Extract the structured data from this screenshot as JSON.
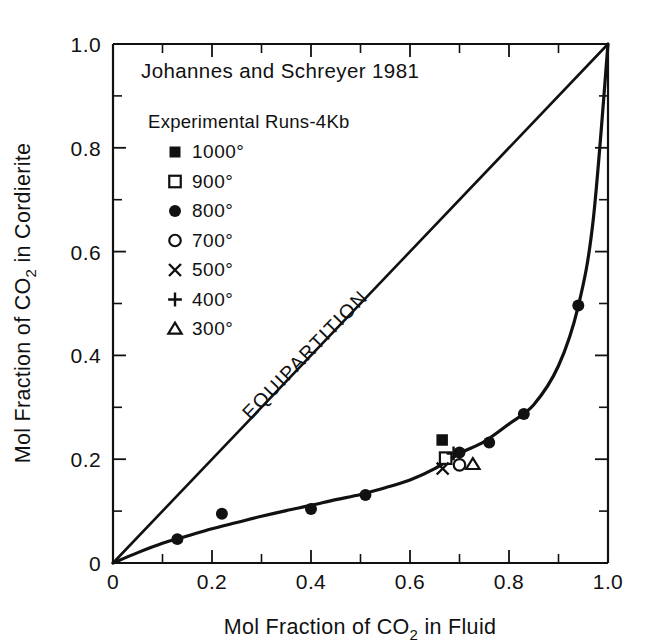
{
  "figure": {
    "title": "Johannes and Schreyer 1981",
    "legend_heading": "Experimental Runs-4Kb",
    "equipartition_label": "EQUIPARTITION"
  },
  "axes": {
    "x": {
      "title_part1": "Mol Fraction of CO",
      "title_sub": "2",
      "title_part2": " in Fluid",
      "ticks": [
        "0",
        "0.2",
        "0.4",
        "0.6",
        "0.8",
        "1.0"
      ],
      "tick_values": [
        0,
        0.2,
        0.4,
        0.6,
        0.8,
        1.0
      ],
      "minor_step": 0.1,
      "range": [
        0,
        1.0
      ]
    },
    "y": {
      "title_part1": "Mol Fraction of CO",
      "title_sub": "2",
      "title_part2": " in Cordierite",
      "ticks": [
        "0",
        "0.2",
        "0.4",
        "0.6",
        "0.8",
        "1.0"
      ],
      "tick_values": [
        0,
        0.2,
        0.4,
        0.6,
        0.8,
        1.0
      ],
      "minor_step": 0.1,
      "range": [
        0,
        1.0
      ]
    }
  },
  "legend": {
    "items": [
      {
        "marker": "filled-square",
        "label": "1000°"
      },
      {
        "marker": "open-square",
        "label": "900°"
      },
      {
        "marker": "filled-circle",
        "label": "800°"
      },
      {
        "marker": "open-circle",
        "label": "700°"
      },
      {
        "marker": "x-cross",
        "label": "500°"
      },
      {
        "marker": "plus",
        "label": "400°"
      },
      {
        "marker": "open-triangle",
        "label": "300°"
      }
    ]
  },
  "chart_data": {
    "type": "scatter",
    "title": "Johannes and Schreyer 1981",
    "xlabel": "Mol Fraction of CO2 in Fluid",
    "ylabel": "Mol Fraction of CO2 in Cordierite",
    "xlim": [
      0,
      1.0
    ],
    "ylim": [
      0,
      1.0
    ],
    "grid": false,
    "legend_position": "upper-left",
    "legend_title": "Experimental Runs-4Kb",
    "annotations": [
      {
        "text": "EQUIPARTITION",
        "along": "diagonal",
        "x": 0.45,
        "y": 0.45,
        "rotation_deg": -46
      }
    ],
    "reference_lines": [
      {
        "name": "equipartition",
        "from": [
          0,
          0
        ],
        "to": [
          1.0,
          1.0
        ],
        "style": "solid"
      }
    ],
    "fitted_curve": {
      "name": "cordierite-fluid isotherm",
      "style": "solid",
      "x": [
        0.0,
        0.05,
        0.1,
        0.15,
        0.2,
        0.25,
        0.3,
        0.35,
        0.4,
        0.45,
        0.5,
        0.55,
        0.6,
        0.65,
        0.7,
        0.75,
        0.8,
        0.85,
        0.9,
        0.94,
        0.97,
        1.0
      ],
      "y": [
        0.0,
        0.02,
        0.038,
        0.052,
        0.066,
        0.078,
        0.09,
        0.101,
        0.111,
        0.122,
        0.132,
        0.145,
        0.16,
        0.182,
        0.211,
        0.234,
        0.268,
        0.305,
        0.38,
        0.495,
        0.66,
        1.0
      ]
    },
    "series": [
      {
        "name": "1000°",
        "marker": "filled-square",
        "points": [
          {
            "x": 0.665,
            "y": 0.237
          }
        ]
      },
      {
        "name": "900°",
        "marker": "open-square",
        "points": [
          {
            "x": 0.672,
            "y": 0.202
          }
        ]
      },
      {
        "name": "800°",
        "marker": "filled-circle",
        "points": [
          {
            "x": 0.13,
            "y": 0.046
          },
          {
            "x": 0.22,
            "y": 0.095
          },
          {
            "x": 0.4,
            "y": 0.104
          },
          {
            "x": 0.51,
            "y": 0.131
          },
          {
            "x": 0.7,
            "y": 0.213
          },
          {
            "x": 0.76,
            "y": 0.232
          },
          {
            "x": 0.83,
            "y": 0.287
          },
          {
            "x": 0.94,
            "y": 0.496
          }
        ]
      },
      {
        "name": "700°",
        "marker": "open-circle",
        "points": [
          {
            "x": 0.7,
            "y": 0.189
          }
        ]
      },
      {
        "name": "500°",
        "marker": "x-cross",
        "points": [
          {
            "x": 0.666,
            "y": 0.182
          }
        ]
      },
      {
        "name": "400°",
        "marker": "plus",
        "points": [
          {
            "x": 0.688,
            "y": 0.211
          }
        ]
      },
      {
        "name": "300°",
        "marker": "open-triangle",
        "points": [
          {
            "x": 0.727,
            "y": 0.19
          }
        ]
      }
    ]
  }
}
